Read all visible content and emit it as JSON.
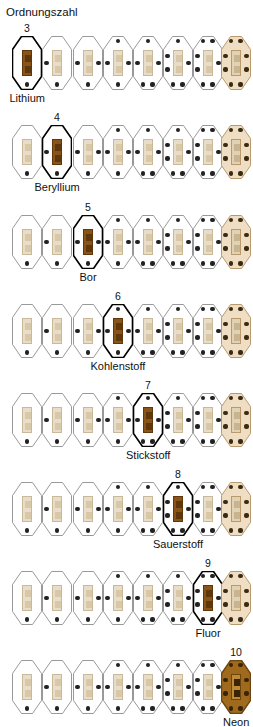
{
  "header": {
    "axis_label": "Ordnungszahl"
  },
  "colors": {
    "pale_outline": "#8d8d8d",
    "pale_core_fill": "#e8ddc8",
    "pale_core_stroke": "#c9b998",
    "pale_inner_square": "#d8c8a8",
    "pale_dot": "#222222",
    "highlight_outline": "#000000",
    "highlight_core_fill": "#8a5418",
    "highlight_core_stroke": "#5e370c",
    "highlight_inner_square": "#5e370c",
    "noble_fill": "#efdec4",
    "noble_outline": "#b89a6c",
    "neon_fill": "#a06a1c",
    "neon_outline": "#6b4510",
    "neon_core_fill": "#c08a34",
    "neon_dot": "#3a2407",
    "background": "#ffffff",
    "text": "#111111"
  },
  "legend": {
    "shell_note": "",
    "columns": 8
  },
  "rows": [
    {
      "row_index": 0,
      "highlight_index": 0,
      "atomic_number": "3",
      "element_name": "Lithium",
      "electrons": [
        1,
        2,
        3,
        4,
        5,
        6,
        7,
        8
      ],
      "number_label": "3"
    },
    {
      "row_index": 1,
      "highlight_index": 1,
      "atomic_number": "4",
      "element_name": "Beryllium",
      "electrons": [
        1,
        2,
        3,
        4,
        5,
        6,
        7,
        8
      ],
      "number_label": "4"
    },
    {
      "row_index": 2,
      "highlight_index": 2,
      "atomic_number": "5",
      "element_name": "Bor",
      "electrons": [
        1,
        2,
        3,
        4,
        5,
        6,
        7,
        8
      ],
      "number_label": "5"
    },
    {
      "row_index": 3,
      "highlight_index": 3,
      "atomic_number": "6",
      "element_name": "Kohlenstoff",
      "electrons": [
        1,
        2,
        3,
        4,
        5,
        6,
        7,
        8
      ],
      "number_label": "6"
    },
    {
      "row_index": 4,
      "highlight_index": 4,
      "atomic_number": "7",
      "element_name": "Stickstoff",
      "electrons": [
        1,
        2,
        3,
        4,
        5,
        6,
        7,
        8
      ],
      "number_label": "7"
    },
    {
      "row_index": 5,
      "highlight_index": 5,
      "atomic_number": "8",
      "element_name": "Sauerstoff",
      "electrons": [
        1,
        2,
        3,
        4,
        5,
        6,
        7,
        8
      ],
      "number_label": "8"
    },
    {
      "row_index": 6,
      "highlight_index": 6,
      "atomic_number": "9",
      "element_name": "Fluor",
      "electrons": [
        1,
        2,
        3,
        4,
        5,
        6,
        7,
        8
      ],
      "number_label": "9"
    },
    {
      "row_index": 7,
      "highlight_index": 7,
      "atomic_number": "10",
      "element_name": "Neon",
      "electrons": [
        1,
        2,
        3,
        4,
        5,
        6,
        7,
        8
      ],
      "number_label": "10"
    }
  ]
}
